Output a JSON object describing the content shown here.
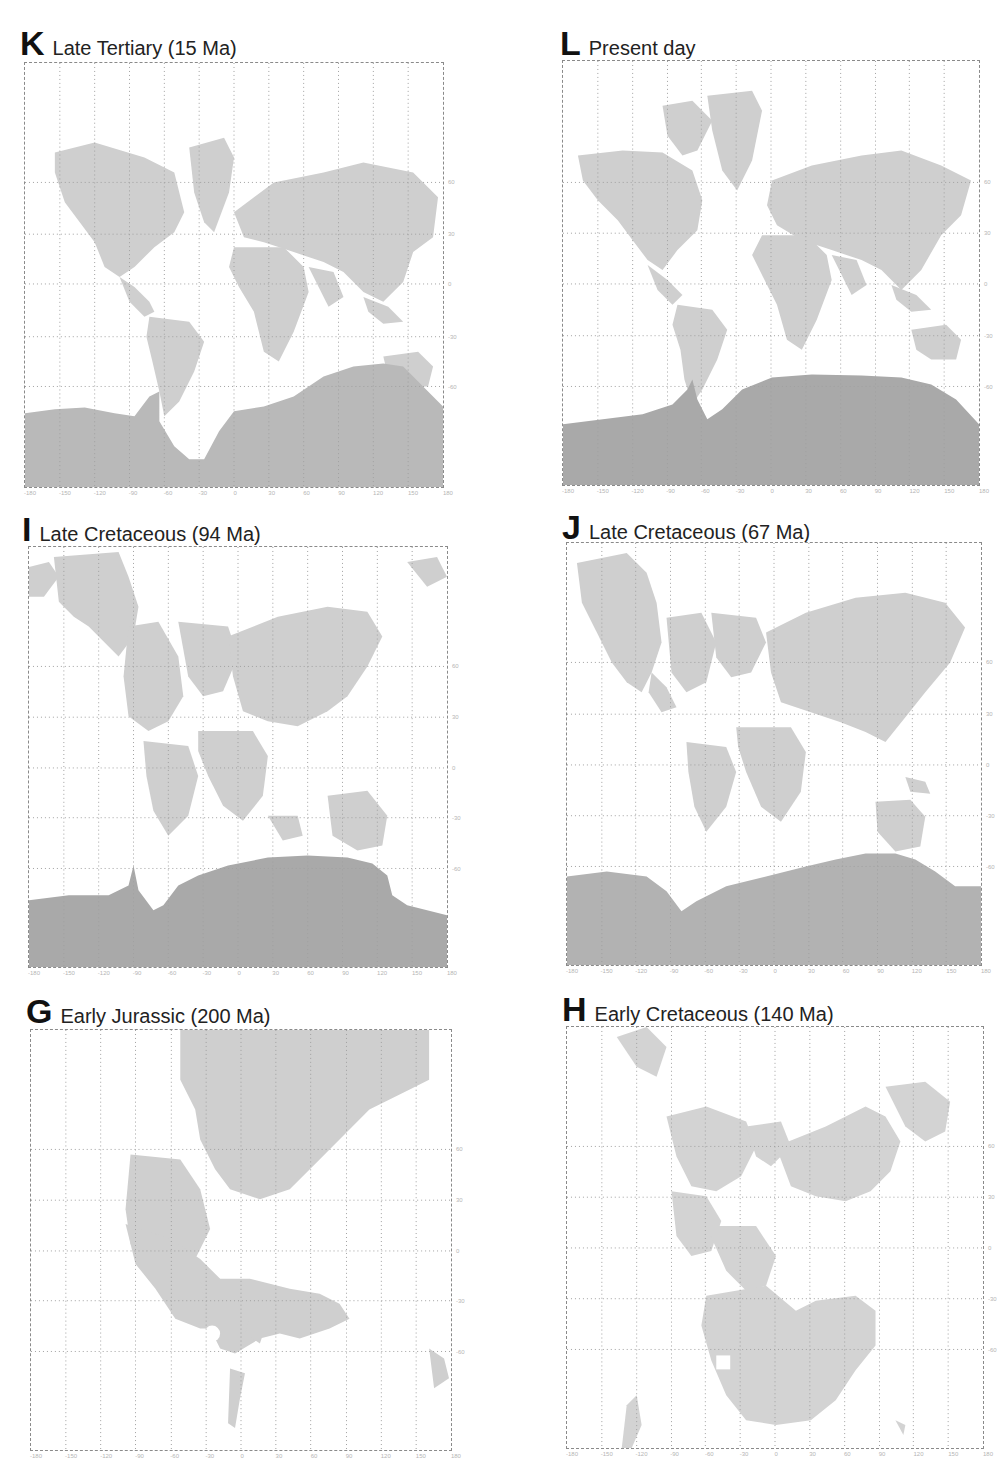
{
  "figure": {
    "land_color": "#c9c9c9",
    "land_dark_color": "#a9a9a9",
    "ocean_color": "#ffffff",
    "grid_color": "#9a9a9a"
  },
  "axis": {
    "longitude_ticks": [
      "-180",
      "-150",
      "-120",
      "-90",
      "-60",
      "-30",
      "0",
      "30",
      "60",
      "90",
      "120",
      "150",
      "180"
    ],
    "latitude_ticks": [
      "60",
      "30",
      "0",
      "-30",
      "-60"
    ]
  },
  "panels": [
    {
      "id": "K",
      "letter": "K",
      "caption": "Late Tertiary (15 Ma)",
      "age_ma": 15
    },
    {
      "id": "L",
      "letter": "L",
      "caption": "Present day",
      "age_ma": 0
    },
    {
      "id": "I",
      "letter": "I",
      "caption": "Late Cretaceous (94 Ma)",
      "age_ma": 94
    },
    {
      "id": "J",
      "letter": "J",
      "caption": "Late Cretaceous (67 Ma)",
      "age_ma": 67
    },
    {
      "id": "G",
      "letter": "G",
      "caption": "Early Jurassic (200 Ma)",
      "age_ma": 200
    },
    {
      "id": "H",
      "letter": "H",
      "caption": "Early Cretaceous (140 Ma)",
      "age_ma": 140
    }
  ]
}
